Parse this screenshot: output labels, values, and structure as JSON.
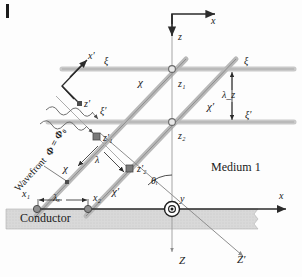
{
  "figure": {
    "medium_label": "Medium 1",
    "conductor_label": "Conductor",
    "wavefront_label": "Wavefront",
    "phase_formula": "Φ = Φ₀"
  },
  "axes": {
    "x_main": "x",
    "z_main": "z",
    "x_lower": "x",
    "y_origin": "y",
    "Z_down": "Z",
    "Z_prime": "Z′",
    "x_prime_inset": "x′",
    "z_prime_inset": "z′"
  },
  "rays": {
    "upper_ray": "χ",
    "lower_ray": "χ′",
    "upper_ray_alt": "χ",
    "lower_ray_alt": "χ′"
  },
  "wavefront_lines": {
    "upper_left": "ξ",
    "upper_right": "ξ",
    "lower_left": "ξ′",
    "lower_right": "ξ′"
  },
  "points": {
    "z1": "z₁",
    "z2": "z₂",
    "z1_prime": "z′₁",
    "z2_prime": "z′₂",
    "x1": "x₁",
    "x2": "x₂"
  },
  "measures": {
    "lambda": "λ",
    "lambda_x": "λₓ",
    "lambda_z": "λ_z",
    "theta_i": "θᵢ"
  },
  "colors": {
    "ray": "#9a9a9a",
    "wavefront_band": "#c9c9c9",
    "conductor_fill": "#d7d7d7",
    "axis": "#333333",
    "marker": "#777777",
    "text": "#1a1a1a"
  }
}
